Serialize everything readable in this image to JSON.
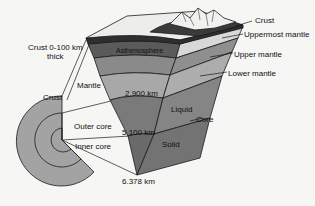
{
  "diagram": {
    "labels": {
      "crust_thickness_line1": "Crust 0-100 km",
      "crust_thickness_line2": "thick",
      "mantle": "Mantle",
      "crust_left": "Crust",
      "asthenosphere": "Asthenosphere",
      "depth_2900": "2,900 km",
      "outer_core": "Outer core",
      "inner_core": "Inner core",
      "depth_5100": "5,100 km",
      "depth_6378": "6.378 km",
      "liquid": "Liquid",
      "solid": "Solid",
      "core": "Core",
      "crust_right": "Crust",
      "uppermost_mantle": "Uppermost mantle",
      "upper_mantle": "Upper mantle",
      "lower_mantle": "Lower mantle"
    },
    "colors": {
      "background": "#f6f6f4",
      "crust_surface": "#ededeb",
      "crust_dark": "#3a3a3a",
      "asthenosphere": "#5a5a5a",
      "upper_mantle": "#8a8a8a",
      "lower_mantle": "#a8a8a8",
      "outer_core": "#7a7a7a",
      "inner_core": "#6a6a6a",
      "globe": "#a3a3a3",
      "line": "#1a1a1a"
    }
  }
}
